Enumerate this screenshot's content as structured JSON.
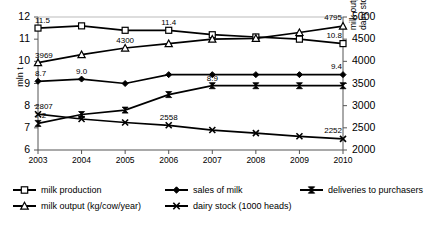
{
  "chart_data": {
    "type": "line",
    "title": "",
    "subtitle": "",
    "xlabel": "",
    "ylabel": "mln t",
    "y2label_line1": "milk output per cow in kg;",
    "y2label_line2": "dairy stock in 1000 heads",
    "categories": [
      "2003",
      "2004",
      "2005",
      "2006",
      "2007",
      "2008",
      "2009",
      "2010"
    ],
    "ylim": [
      6,
      12
    ],
    "yticks": [
      "6",
      "7",
      "8",
      "9",
      "10",
      "11",
      "12"
    ],
    "y2lim": [
      2000,
      5000
    ],
    "y2ticks": [
      "2000",
      "2500",
      "3000",
      "3500",
      "4000",
      "4500",
      "5000"
    ],
    "grid": false,
    "legend_position": "bottom",
    "series": [
      {
        "name": "milk production",
        "axis": "left",
        "marker": "square-open",
        "values": [
          11.5,
          11.6,
          11.4,
          11.4,
          11.2,
          11.1,
          11.0,
          10.8
        ],
        "labels": [
          {
            "index": 0,
            "text": "11.5"
          },
          {
            "index": 3,
            "text": "11.4"
          },
          {
            "index": 7,
            "text": "10.8"
          }
        ]
      },
      {
        "name": "sales of milk",
        "axis": "left",
        "marker": "diamond-filled",
        "values": [
          9.1,
          9.2,
          9.0,
          9.4,
          9.4,
          9.4,
          9.4,
          9.4
        ],
        "labels": [
          {
            "index": 0,
            "text": "8.7"
          },
          {
            "index": 1,
            "text": "9.0"
          },
          {
            "index": 7,
            "text": "9.4"
          }
        ]
      },
      {
        "name": "deliveries to purchasers",
        "axis": "left",
        "marker": "bowtie-filled",
        "values": [
          7.2,
          7.6,
          7.8,
          8.5,
          8.9,
          8.9,
          8.9,
          8.9
        ],
        "labels": [
          {
            "index": 0,
            "text": "7.2"
          },
          {
            "index": 4,
            "text": "8.9"
          }
        ]
      },
      {
        "name": "milk output (kg/cow/year)",
        "axis": "right",
        "marker": "triangle-open",
        "values": [
          3969,
          4150,
          4300,
          4400,
          4500,
          4520,
          4650,
          4795
        ],
        "labels": [
          {
            "index": 0,
            "text": "3969"
          },
          {
            "index": 2,
            "text": "4300"
          },
          {
            "index": 7,
            "text": "4795"
          }
        ]
      },
      {
        "name": "dairy stock (1000 heads)",
        "axis": "right",
        "marker": "cross-x",
        "values": [
          2807,
          2700,
          2620,
          2558,
          2450,
          2380,
          2310,
          2252
        ],
        "labels": [
          {
            "index": 0,
            "text": "2807"
          },
          {
            "index": 3,
            "text": "2558"
          },
          {
            "index": 7,
            "text": "2252"
          }
        ]
      }
    ],
    "legend": [
      {
        "label": "milk production",
        "marker": "square-open"
      },
      {
        "label": "sales of milk",
        "marker": "diamond-filled"
      },
      {
        "label": "deliveries to purchasers",
        "marker": "bowtie-filled"
      },
      {
        "label": "milk output (kg/cow/year)",
        "marker": "triangle-open"
      },
      {
        "label": "dairy stock (1000 heads)",
        "marker": "cross-x"
      }
    ]
  }
}
